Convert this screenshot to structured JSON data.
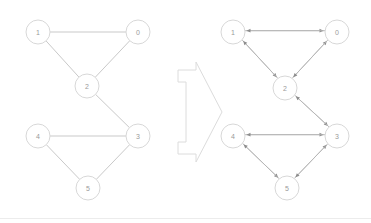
{
  "figure": {
    "background_color": "#ffffff",
    "node_stroke_color": "#d8d8d8",
    "node_fill_color": "#ffffff",
    "edge_color": "#c9c9c9",
    "arrow_color": "#8d8d8d",
    "label_color": "#9a9a9a",
    "separator_color": "#ececec"
  },
  "transform_arrow": {
    "name": "right-block-arrow",
    "label": "",
    "direction": "right"
  },
  "left_graph": {
    "name": "undirected-graph",
    "caption": "",
    "directed": false,
    "nodes": [
      {
        "id": "1",
        "label": "1",
        "cx": 38,
        "cy": 32,
        "r": 12
      },
      {
        "id": "0",
        "label": "0",
        "cx": 138,
        "cy": 32,
        "r": 12
      },
      {
        "id": "2",
        "label": "2",
        "cx": 87,
        "cy": 86,
        "r": 12
      },
      {
        "id": "4",
        "label": "4",
        "cx": 38,
        "cy": 136,
        "r": 12
      },
      {
        "id": "3",
        "label": "3",
        "cx": 138,
        "cy": 136,
        "r": 12
      },
      {
        "id": "5",
        "label": "5",
        "cx": 88,
        "cy": 188,
        "r": 12
      }
    ],
    "edges": [
      {
        "from": "1",
        "to": "0"
      },
      {
        "from": "1",
        "to": "2"
      },
      {
        "from": "2",
        "to": "0"
      },
      {
        "from": "2",
        "to": "3"
      },
      {
        "from": "4",
        "to": "3"
      },
      {
        "from": "4",
        "to": "5"
      },
      {
        "from": "5",
        "to": "3"
      }
    ]
  },
  "right_graph": {
    "name": "directed-graph",
    "caption": "",
    "directed": true,
    "nodes": [
      {
        "id": "1",
        "label": "1",
        "cx": 233,
        "cy": 32,
        "r": 12
      },
      {
        "id": "0",
        "label": "0",
        "cx": 337,
        "cy": 32,
        "r": 12
      },
      {
        "id": "2",
        "label": "2",
        "cx": 285,
        "cy": 88,
        "r": 12
      },
      {
        "id": "4",
        "label": "4",
        "cx": 233,
        "cy": 136,
        "r": 12
      },
      {
        "id": "3",
        "label": "3",
        "cx": 337,
        "cy": 136,
        "r": 12
      },
      {
        "id": "5",
        "label": "5",
        "cx": 287,
        "cy": 188,
        "r": 12
      }
    ],
    "edges": [
      {
        "from": "1",
        "to": "0"
      },
      {
        "from": "0",
        "to": "1"
      },
      {
        "from": "1",
        "to": "2"
      },
      {
        "from": "2",
        "to": "1"
      },
      {
        "from": "2",
        "to": "0"
      },
      {
        "from": "0",
        "to": "2"
      },
      {
        "from": "2",
        "to": "3"
      },
      {
        "from": "3",
        "to": "2"
      },
      {
        "from": "4",
        "to": "3"
      },
      {
        "from": "3",
        "to": "4"
      },
      {
        "from": "4",
        "to": "5"
      },
      {
        "from": "5",
        "to": "4"
      },
      {
        "from": "5",
        "to": "3"
      },
      {
        "from": "3",
        "to": "5"
      }
    ]
  }
}
